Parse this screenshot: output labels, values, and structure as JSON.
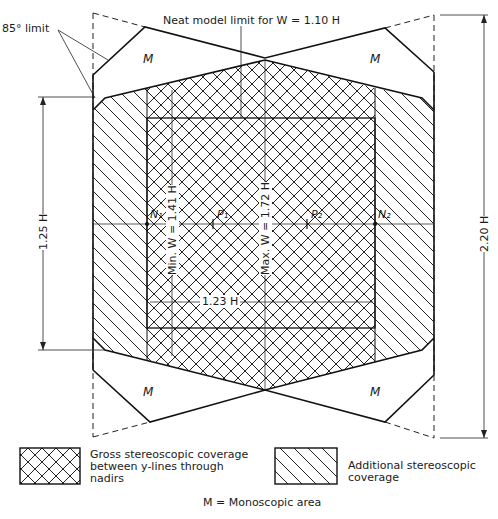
{
  "diagram": {
    "title_annotation": "Neat model limit for W = 1.10 H",
    "angle_limit": "85° limit",
    "dimensions": {
      "left_height": "1.25 H",
      "right_height": "2.20 H",
      "min_width": "Min. W = 1.41 H",
      "max_width": "Max. W = 1.72 H",
      "base": "1.23 H"
    },
    "points": {
      "nadir_1": "N₁",
      "principal_1": "P₁",
      "principal_2": "P₂",
      "nadir_2": "N₂"
    },
    "mono_label": "M",
    "regions": [
      {
        "name": "top-left-monoscopic",
        "label": "M"
      },
      {
        "name": "top-right-monoscopic",
        "label": "M"
      },
      {
        "name": "bottom-left-monoscopic",
        "label": "M"
      },
      {
        "name": "bottom-right-monoscopic",
        "label": "M"
      }
    ]
  },
  "legend": {
    "gross": "Gross stereoscopic coverage between y-lines through nadirs",
    "gross_lines": [
      "Gross stereoscopic coverage",
      "between y-lines through",
      "nadirs"
    ],
    "additional_lines": [
      "Additional stereoscopic",
      "coverage"
    ],
    "mono_key": "M = Monoscopic area"
  }
}
